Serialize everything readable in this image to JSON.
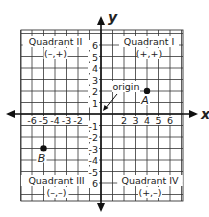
{
  "diagram": {
    "type": "coordinate-plane",
    "axes": {
      "x_label": "x",
      "y_label": "y",
      "range": [
        -7,
        7
      ]
    },
    "x_ticks": [
      {
        "value": -6,
        "label": "-6"
      },
      {
        "value": -5,
        "label": "-5"
      },
      {
        "value": -4,
        "label": "-4"
      },
      {
        "value": -3,
        "label": "-3"
      },
      {
        "value": -2,
        "label": "-2"
      },
      {
        "value": 2,
        "label": "2"
      },
      {
        "value": 3,
        "label": "3"
      },
      {
        "value": 4,
        "label": "4"
      },
      {
        "value": 5,
        "label": "5"
      },
      {
        "value": 6,
        "label": "6"
      }
    ],
    "y_ticks": [
      {
        "value": 6,
        "label": "6"
      },
      {
        "value": 5,
        "label": "5"
      },
      {
        "value": 4,
        "label": "4"
      },
      {
        "value": 3,
        "label": "3"
      },
      {
        "value": 2,
        "label": "2"
      },
      {
        "value": 1,
        "label": "1"
      },
      {
        "value": -1,
        "label": "-1"
      },
      {
        "value": -2,
        "label": "-2"
      },
      {
        "value": -3,
        "label": "-3"
      },
      {
        "value": -4,
        "label": "-4"
      },
      {
        "value": -5,
        "label": "-5"
      },
      {
        "value": -6,
        "label": "-6"
      }
    ],
    "quadrants": [
      {
        "name": "Quadrant II",
        "signs": "(–,+)"
      },
      {
        "name": "Quadrant I",
        "signs": "(+,+)"
      },
      {
        "name": "Quadrant III",
        "signs": "(–,–)"
      },
      {
        "name": "Quadrant IV",
        "signs": "(+,–)"
      }
    ],
    "points": [
      {
        "label": "A",
        "x": 4,
        "y": 2
      },
      {
        "label": "B",
        "x": -5,
        "y": -3
      }
    ],
    "origin_label": "origin"
  }
}
